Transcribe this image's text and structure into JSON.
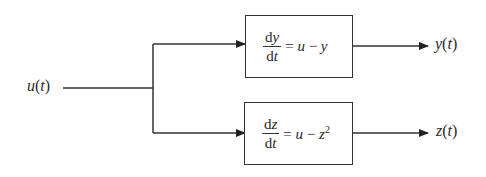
{
  "diagram": {
    "input": {
      "label": "u(t)",
      "var": "u",
      "arg": "t"
    },
    "blocks": [
      {
        "id": "block-y",
        "numerator_d": "d",
        "numerator_var": "y",
        "denominator_d": "d",
        "denominator_var": "t",
        "rhs_prefix": "= ",
        "rhs_u": "u",
        "rhs_op": " − ",
        "rhs_var": "y",
        "rhs_exp": "",
        "equation": "dy/dt = u − y",
        "output": {
          "label": "y(t)",
          "var": "y",
          "arg": "t"
        }
      },
      {
        "id": "block-z",
        "numerator_d": "d",
        "numerator_var": "z",
        "denominator_d": "d",
        "denominator_var": "t",
        "rhs_prefix": "= ",
        "rhs_u": "u",
        "rhs_op": " − ",
        "rhs_var": "z",
        "rhs_exp": "2",
        "equation": "dz/dt = u − z^2",
        "output": {
          "label": "z(t)",
          "var": "z",
          "arg": "t"
        }
      }
    ],
    "colors": {
      "line": "#333333",
      "text": "#2a2a2a",
      "background": "#ffffff"
    }
  }
}
